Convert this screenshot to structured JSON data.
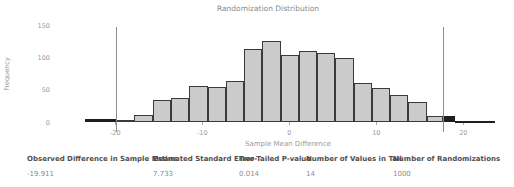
{
  "chart_data": {
    "type": "histogram",
    "title": "Randomization Distribution",
    "xlabel": "Sample Mean Difference",
    "ylabel": "Frequency",
    "x_ticks": [
      -20,
      -10,
      0,
      10,
      20
    ],
    "y_ticks": [
      0,
      50,
      100,
      150
    ],
    "xlim": [
      -26.5,
      25.5
    ],
    "ylim": [
      0,
      155
    ],
    "grid": false,
    "legend": "none",
    "cutoff_lines": [
      -19.911,
      17.7
    ],
    "bar_colors": {
      "light": "#cbcbcb",
      "dark": "#1f1f1f",
      "border": "#3a3a3a"
    },
    "bars": [
      {
        "from": -23.5,
        "to": -19.9,
        "freq": 5,
        "color": "dark"
      },
      {
        "from": -19.9,
        "to": -17.8,
        "freq": 4,
        "color": "light"
      },
      {
        "from": -17.8,
        "to": -15.7,
        "freq": 11,
        "color": "light"
      },
      {
        "from": -15.7,
        "to": -13.6,
        "freq": 35,
        "color": "light"
      },
      {
        "from": -13.6,
        "to": -11.5,
        "freq": 38,
        "color": "light"
      },
      {
        "from": -11.5,
        "to": -9.4,
        "freq": 56,
        "color": "light"
      },
      {
        "from": -9.4,
        "to": -7.3,
        "freq": 54,
        "color": "light"
      },
      {
        "from": -7.3,
        "to": -5.2,
        "freq": 64,
        "color": "light"
      },
      {
        "from": -5.2,
        "to": -3.1,
        "freq": 114,
        "color": "light"
      },
      {
        "from": -3.1,
        "to": -1.0,
        "freq": 126,
        "color": "light"
      },
      {
        "from": -1.0,
        "to": 1.1,
        "freq": 104,
        "color": "light"
      },
      {
        "from": 1.1,
        "to": 3.2,
        "freq": 110,
        "color": "light"
      },
      {
        "from": 3.2,
        "to": 5.3,
        "freq": 108,
        "color": "light"
      },
      {
        "from": 5.3,
        "to": 7.4,
        "freq": 100,
        "color": "light"
      },
      {
        "from": 7.4,
        "to": 9.5,
        "freq": 61,
        "color": "light"
      },
      {
        "from": 9.5,
        "to": 11.6,
        "freq": 53,
        "color": "light"
      },
      {
        "from": 11.6,
        "to": 13.7,
        "freq": 42,
        "color": "light"
      },
      {
        "from": 13.7,
        "to": 15.8,
        "freq": 31,
        "color": "light"
      },
      {
        "from": 15.8,
        "to": 17.7,
        "freq": 9,
        "color": "light"
      },
      {
        "from": 17.7,
        "to": 19.1,
        "freq": 9,
        "color": "dark"
      },
      {
        "from": 19.1,
        "to": 21.7,
        "freq": 2,
        "color": "dark"
      },
      {
        "from": 21.7,
        "to": 23.7,
        "freq": 2,
        "color": "dark"
      }
    ]
  },
  "stats": [
    {
      "label": "Observed Difference in Sample Means",
      "value": "-19.911"
    },
    {
      "label": "Estimated Standard Error",
      "value": "7.733"
    },
    {
      "label": "Two-Tailed P-value",
      "value": "0.014"
    },
    {
      "label": "Number of Values in Tail",
      "value": "14"
    },
    {
      "label": "Number of Randomizations",
      "value": "1000"
    }
  ]
}
